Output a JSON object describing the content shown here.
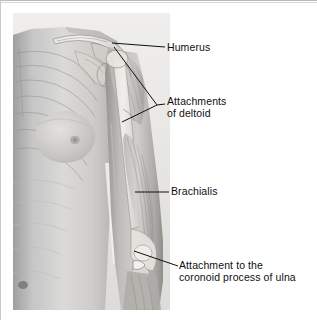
{
  "figure": {
    "kind": "anatomical-illustration",
    "view": "anterior",
    "background_color": "#ffffff",
    "ink_color": "#101010",
    "plate": {
      "style": "grayscale photograph with transparent skeletal overlay",
      "x": 13,
      "y": 13,
      "width": 157,
      "height": 297
    }
  },
  "labels": [
    {
      "id": "humerus",
      "text": "Humerus",
      "lines": [
        "Humerus"
      ],
      "leader": "diagonal",
      "points_to": "shaft of humerus at surgical neck"
    },
    {
      "id": "deltoid",
      "text": "Attachments of deltoid",
      "lines": [
        "Attachments",
        "of deltoid"
      ],
      "leader": "bracket",
      "points_to": "greater tubercle and deltoid tuberosity"
    },
    {
      "id": "brachialis",
      "text": "Brachialis",
      "lines": [
        "Brachialis"
      ],
      "leader": "horizontal",
      "points_to": "brachialis muscle belly"
    },
    {
      "id": "ulna",
      "text": "Attachment to the coronoid process of ulna",
      "lines": [
        "Attachment to the",
        "coronoid process of ulna"
      ],
      "leader": "diagonal",
      "points_to": "coronoid process of ulna at elbow"
    }
  ]
}
